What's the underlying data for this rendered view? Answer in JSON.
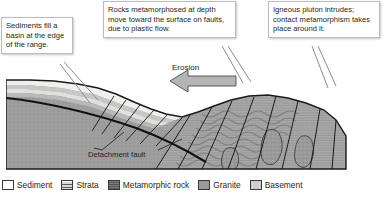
{
  "figure": {
    "type": "geologic-cross-section"
  },
  "callouts": [
    {
      "id": "sediments",
      "text": "Sediments fill a basin at the edge of the range."
    },
    {
      "id": "metamorphism",
      "text": "Rocks metamorphosed at depth move toward the surface on faults, due to plastic flow."
    },
    {
      "id": "pluton",
      "text": "Igneous pluton intrudes; contact metamorphism takes place around it."
    }
  ],
  "figure_labels": {
    "erosion": "Erosion",
    "detachment_fault": "Detachment fault"
  },
  "legend": {
    "items": [
      {
        "label": "Sediment",
        "swatch": "sediment",
        "color": "#ffffff"
      },
      {
        "label": "Strata",
        "swatch": "strata",
        "color": "#d8d8d8"
      },
      {
        "label": "Metamorphic rock",
        "swatch": "metamorphic",
        "color": "#6e6e6e"
      },
      {
        "label": "Granite",
        "swatch": "granite",
        "color": "#9a9a9a"
      },
      {
        "label": "Basement",
        "swatch": "basement",
        "color": "#cfcfcf"
      }
    ]
  },
  "colors": {
    "basement": "#9d9d9d",
    "metamorphic": "#a5a5a5",
    "sediment": "#f2f2f0",
    "strata": "#c9c9c9",
    "granite": "#8f8f8f",
    "outline": "#1a1a1a",
    "callout_border": "#b9bbbd"
  }
}
